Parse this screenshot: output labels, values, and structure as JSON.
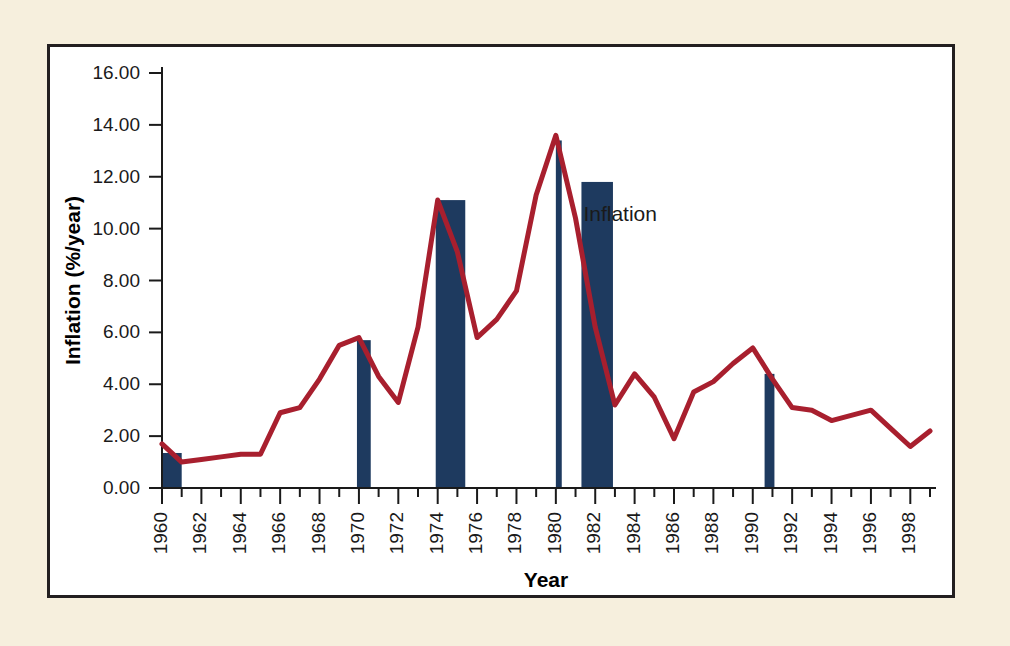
{
  "page": {
    "background_color": "#f6efdd",
    "panel_background": "#ffffff",
    "panel_border_color": "#231f20"
  },
  "chart_data": {
    "type": "line",
    "title": "",
    "xlabel": "Year",
    "ylabel": "Inflation (%/year)",
    "xlim": [
      1960,
      1999
    ],
    "ylim": [
      0.0,
      16.0
    ],
    "grid": false,
    "legend_position": "inline-annotation",
    "series_color": "#a81f2e",
    "recession_bar_color": "#1e3a5f",
    "annotations": [
      {
        "text": "Inflation",
        "x": 1981.4,
        "y": 10.3
      }
    ],
    "ytick_labels": [
      "0.00",
      "2.00",
      "4.00",
      "6.00",
      "8.00",
      "10.00",
      "12.00",
      "14.00",
      "16.00"
    ],
    "ytick_values": [
      0,
      2,
      4,
      6,
      8,
      10,
      12,
      14,
      16
    ],
    "xtick_labels": [
      "1960",
      "1962",
      "1964",
      "1966",
      "1968",
      "1970",
      "1972",
      "1974",
      "1976",
      "1978",
      "1980",
      "1982",
      "1984",
      "1986",
      "1988",
      "1990",
      "1992",
      "1994",
      "1996",
      "1998"
    ],
    "xtick_values": [
      1960,
      1962,
      1964,
      1966,
      1968,
      1970,
      1972,
      1974,
      1976,
      1978,
      1980,
      1982,
      1984,
      1986,
      1988,
      1990,
      1992,
      1994,
      1996,
      1998
    ],
    "x": [
      1960,
      1961,
      1962,
      1963,
      1964,
      1965,
      1966,
      1967,
      1968,
      1969,
      1970,
      1971,
      1972,
      1973,
      1974,
      1975,
      1976,
      1977,
      1978,
      1979,
      1980,
      1981,
      1982,
      1983,
      1984,
      1985,
      1986,
      1987,
      1988,
      1989,
      1990,
      1991,
      1992,
      1993,
      1994,
      1995,
      1996,
      1997,
      1998,
      1999
    ],
    "values": [
      1.7,
      1.0,
      1.1,
      1.2,
      1.3,
      1.3,
      2.9,
      3.1,
      4.2,
      5.5,
      5.8,
      4.3,
      3.3,
      6.2,
      11.1,
      9.1,
      5.8,
      6.5,
      7.6,
      11.3,
      13.6,
      10.4,
      6.2,
      3.2,
      4.4,
      3.5,
      1.9,
      3.7,
      4.1,
      4.8,
      5.4,
      4.2,
      3.1,
      3.0,
      2.6,
      2.8,
      3.0,
      2.3,
      1.6,
      2.2
    ],
    "recession_bars": [
      {
        "label": "1960-1961 recession",
        "start": 1960.0,
        "end": 1961.0,
        "top": 1.35
      },
      {
        "label": "1970 recession",
        "start": 1969.9,
        "end": 1970.6,
        "top": 5.7
      },
      {
        "label": "1974-1975 recession",
        "start": 1973.9,
        "end": 1975.4,
        "top": 11.1
      },
      {
        "label": "1980 recession",
        "start": 1980.0,
        "end": 1980.3,
        "top": 13.4
      },
      {
        "label": "1981-1982 recession",
        "start": 1981.3,
        "end": 1982.9,
        "top": 11.8
      },
      {
        "label": "1990-1991 recession",
        "start": 1990.6,
        "end": 1991.1,
        "top": 4.4
      }
    ]
  }
}
